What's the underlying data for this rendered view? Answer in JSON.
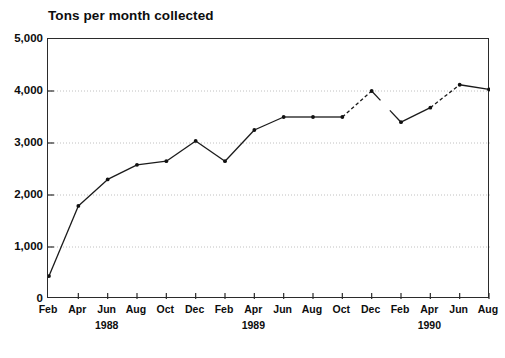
{
  "chart_data": {
    "type": "line",
    "title": "Tons per month collected",
    "xlabel": "",
    "ylabel": "",
    "ylim": [
      0,
      5000
    ],
    "ytick_labels": [
      "0",
      "1,000",
      "2,000",
      "3,000",
      "4,000",
      "5,000"
    ],
    "ytick_values": [
      0,
      1000,
      2000,
      3000,
      4000,
      5000
    ],
    "grid": "horizontal-dotted",
    "legend": "none",
    "categories": [
      "Feb 1988",
      "Apr 1988",
      "Jun 1988",
      "Aug 1988",
      "Oct 1988",
      "Dec 1988",
      "Feb 1989",
      "Apr 1989",
      "Jun 1989",
      "Aug 1989",
      "Oct 1989",
      "Dec 1989",
      "Feb 1990",
      "Apr 1990",
      "Jun 1990",
      "Aug 1990"
    ],
    "xtick_labels": [
      "Feb",
      "Apr",
      "Jun",
      "Aug",
      "Oct",
      "Dec",
      "Feb",
      "Apr",
      "Jun",
      "Aug",
      "Oct",
      "Dec",
      "Feb",
      "Apr",
      "Jun",
      "Aug"
    ],
    "xtick_year_labels": [
      {
        "index": 2,
        "label": "1988"
      },
      {
        "index": 7,
        "label": "1989"
      },
      {
        "index": 13,
        "label": "1990"
      }
    ],
    "values": [
      440,
      1790,
      2300,
      2580,
      2650,
      3040,
      2650,
      3250,
      3500,
      3500,
      3500,
      4000,
      3400,
      3680,
      4120,
      4030
    ],
    "dashed_segments": [
      [
        10,
        11
      ],
      [
        13,
        14
      ]
    ],
    "broken_segments": [
      [
        11,
        12
      ]
    ],
    "series": [
      {
        "name": "Tons per month collected",
        "values": [
          440,
          1790,
          2300,
          2580,
          2650,
          3040,
          2650,
          3250,
          3500,
          3500,
          3500,
          4000,
          3400,
          3680,
          4120,
          4030
        ]
      }
    ],
    "line_color": "#1a1a1a",
    "marker_color": "#111111",
    "grid_color": "#b9b9b9",
    "axis_color": "#2b2b2b"
  }
}
